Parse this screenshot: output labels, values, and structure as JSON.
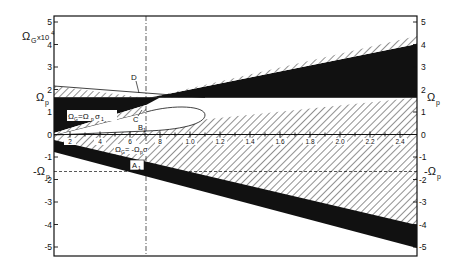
{
  "figure": {
    "y_axis_label": "Ω_G x10⁴",
    "y_axis_label_main": "Ω",
    "y_axis_label_sub": "G",
    "y_axis_label_mult": "x10",
    "y_axis_label_exp": "4",
    "left_y_ticks": [
      "5",
      "4",
      "3",
      "2",
      "1",
      "0",
      "-1",
      "-2",
      "-3",
      "-4",
      "-5"
    ],
    "right_y_ticks": [
      "5",
      "4",
      "3",
      "2",
      "1",
      "0",
      "-1",
      "-2",
      "-3",
      "-4",
      "-5"
    ],
    "x_ticks": [
      "2",
      "4",
      "6",
      "8",
      "1.0",
      "1.2",
      "1.4",
      "1.6",
      "1.8",
      "2.0",
      "2.2",
      "2.4"
    ],
    "omega_p_label": "Ω",
    "omega_p_sub": "p",
    "neg_omega_p_label": "-Ω",
    "neg_omega_p_sub": "p",
    "annotations": {
      "D": "D",
      "C": "C",
      "B1": "B",
      "B1_sub": "1",
      "A1": "A",
      "A1_sub": "1",
      "upper_relation": "Ω_G = Ω_p σ_1",
      "upper_relation_main": "Ω",
      "upper_relation_g": "G",
      "upper_relation_eq": "=Ω",
      "upper_relation_p": "p",
      "upper_relation_sigma": "σ",
      "upper_relation_one": "1",
      "lower_relation_main": "Ω",
      "lower_relation_g": "G",
      "lower_relation_eq": "= -Ω",
      "lower_relation_p": "p",
      "lower_relation_sigma": "σ"
    },
    "colors": {
      "ink": "#111111",
      "paper": "#ffffff",
      "hatch": "#333333"
    }
  }
}
